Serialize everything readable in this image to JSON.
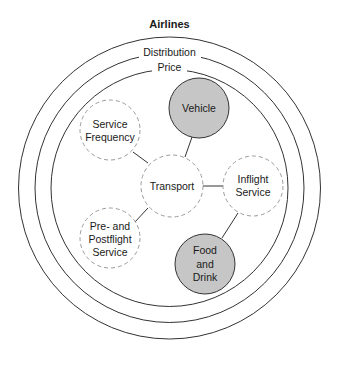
{
  "title": "Airlines",
  "rings": [
    {
      "label": "Distribution",
      "cx": 169.5,
      "cy": 188,
      "r": 151
    },
    {
      "label": "Price",
      "cx": 169.5,
      "cy": 188,
      "r": 134.5
    },
    {
      "label": "",
      "cx": 169.5,
      "cy": 188,
      "r": 118.5
    }
  ],
  "nodes": {
    "transport": {
      "lines": [
        "Transport"
      ],
      "style": "dashed"
    },
    "vehicle": {
      "lines": [
        "Vehicle"
      ],
      "style": "filled"
    },
    "service_frequency": {
      "lines": [
        "Service",
        "Frequency"
      ],
      "style": "dashed"
    },
    "inflight_service": {
      "lines": [
        "Inflight",
        "Service"
      ],
      "style": "dashed"
    },
    "pre_postflight_service": {
      "lines": [
        "Pre- and",
        "Postflight",
        "Service"
      ],
      "style": "dashed"
    },
    "food_and_drink": {
      "lines": [
        "Food",
        "and",
        "Drink"
      ],
      "style": "filled"
    }
  },
  "edges": [
    {
      "from": "Transport",
      "to": "Vehicle"
    },
    {
      "from": "Transport",
      "to": "Service Frequency"
    },
    {
      "from": "Transport",
      "to": "Inflight Service"
    },
    {
      "from": "Transport",
      "to": "Pre- and Postflight Service"
    },
    {
      "from": "Inflight Service",
      "to": "Food and Drink"
    }
  ],
  "colors": {
    "filled_node": "#c6c6c6",
    "dashed_stroke": "#9a9a9a",
    "line": "#333333"
  }
}
